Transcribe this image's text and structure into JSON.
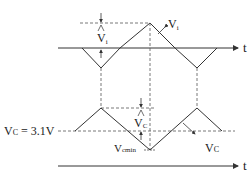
{
  "diagram": {
    "top_axis_label": "t",
    "bottom_axis_label": "t",
    "vi_curve_label": "V",
    "vi_curve_label_sub": "i",
    "vi_amplitude_label": "V",
    "vi_amplitude_label_sub": "i",
    "vc_delta_label": "V",
    "vc_delta_label_sub": "C",
    "vc_level_label": "V",
    "vc_level_label_sub": "C",
    "vc_level_value": " = 3.1V",
    "vcmin_label": "V",
    "vcmin_label_sub": "cmin",
    "vc_curve_label": "V",
    "vc_curve_label_sub": "C",
    "colors": {
      "line": "#333333",
      "dashed": "#555555",
      "background": "#ffffff"
    }
  }
}
